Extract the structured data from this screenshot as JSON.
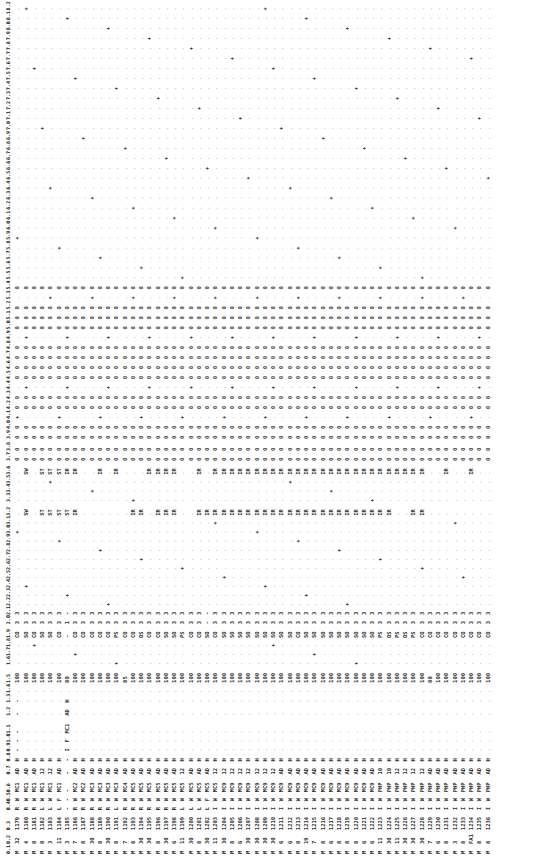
{
  "document": {
    "orientation": "rotated-90-ccw",
    "headers": [
      "0.1",
      "0.2",
      "0.3",
      "0.4",
      "0.5",
      "0.6",
      "0.7",
      "0.8",
      "0.9",
      "1.0",
      "1.1",
      "1.2",
      "1.3",
      "1.6",
      "1.5",
      "1.6",
      "1.7",
      "1.8",
      "1.9",
      "2.0",
      "2.1",
      "2.2",
      "2.3",
      "2.4",
      "2.5",
      "2.6",
      "2.7",
      "2.8",
      "2.9",
      "3.0",
      "3.1",
      "3.2",
      "3.3",
      "3.4",
      "3.5",
      "3.6",
      "3.7",
      "3.8",
      "3.9",
      "4.0",
      "4.1",
      "4.2",
      "4.3",
      "4.4",
      "4.5",
      "4.6",
      "4.7",
      "4.8",
      "4.9",
      "5.0",
      "5.1",
      "5.2",
      "5.3",
      "5.4",
      "5.5",
      "5.6",
      "5.7",
      "5.8",
      "5.9",
      "6.0",
      "6.1",
      "6.2",
      "6.3",
      "6.4",
      "6.5",
      "6.6",
      "6.7",
      "6.8",
      "6.9",
      "7.0",
      "7.1",
      "7.2",
      "7.3",
      "7.4",
      "7.5",
      "7.6",
      "7.7",
      "7.8",
      "7.9",
      "8.0",
      "8.1",
      "8.2"
    ],
    "rows": [
      {
        "c01": "M",
        "c02": "32",
        "c03": "1179",
        "c04": "R",
        "c05": "W",
        "c06": "MC1",
        "c07": "AD",
        "c08": "H",
        "c09": "-",
        "c10": "-",
        "c11": "-",
        "c12": "-",
        "c13": "-",
        "c14": "-",
        "c15": "100",
        "c16": "0",
        "c17": "*",
        "c18": "-",
        "c19": "CO",
        "c20": "3",
        "c21": "3",
        "c22": "+",
        "c23": ".",
        "c24": ".",
        "c25": ".",
        "c26": ".",
        "c27": ".",
        "c28": ".",
        "c29": ".",
        "c30": ".",
        "c31": ".",
        "c32": ".",
        "c33": ".",
        "c34": ".",
        "c35": ".",
        "c36": ".",
        "c37": "0",
        "c38": "0",
        "sw1": ".",
        "sw2": "."
      },
      {
        "c01": "M",
        "c02": "4",
        "c03": "1180",
        "c04": "R",
        "c05": "W",
        "c06": "MC1",
        "c07": "AD",
        "c08": "H",
        "c15": "100",
        "c19": "SO",
        "c20": "3",
        "c21": "3",
        "sw1": "SW",
        "sw2": "SW"
      },
      {
        "c01": "M",
        "c02": "8",
        "c03": "1181",
        "c04": "R",
        "c05": "W",
        "c06": "MC1",
        "c07": "AD",
        "c08": "H",
        "c15": "100",
        "c19": "CO",
        "c20": "3",
        "c21": "3",
        "sw1": ".",
        "sw2": "."
      },
      {
        "c01": "M",
        "c02": "8",
        "c03": "1182",
        "c04": "L",
        "c05": "W",
        "c06": "MC1",
        "c07": "12",
        "c08": "H",
        "c15": "100",
        "c19": "SO",
        "c20": "3",
        "c21": "3",
        "sw1": "ST",
        "sw2": "ST"
      },
      {
        "c01": "M",
        "c02": "3",
        "c03": "1183",
        "c04": "L",
        "c05": "W",
        "c06": "MC1",
        "c07": "12",
        "c08": "H",
        "c15": "100",
        "c19": "SO",
        "c20": "3",
        "c21": "3",
        "sw1": "ST",
        "sw2": "ST"
      },
      {
        "c01": "M",
        "c02": "11",
        "c03": "1184",
        "c04": "L",
        "c05": "F",
        "c06": "MC1",
        "c07": "AD",
        "c08": "H",
        "c15": "100",
        "c19": "CO",
        "c20": "3",
        "c21": "3",
        "sw1": "ST",
        "sw2": "ST"
      },
      {
        "c01": "M",
        "c02": "3",
        "c03": "1185",
        "c04": "-",
        "c05": "-",
        "c06": "-",
        "c07": "-",
        "c08": "-",
        "c09": "I",
        "c10": "F",
        "c11": "MC1",
        "c12": "AD",
        "c13": "H",
        "c15": "80",
        "c19": "-",
        "c20": "1",
        "c21": "-",
        "sw1": "ST",
        "sw2": "IR"
      },
      {
        "c01": "M",
        "c02": "7",
        "c03": "1186",
        "c04": "R",
        "c05": "W",
        "c06": "MC2",
        "c07": "AD",
        "c08": "H",
        "c15": "100",
        "c19": "CO",
        "c20": "3",
        "c21": "3",
        "sw1": "IR",
        "sw2": "IR"
      },
      {
        "c01": "M",
        "c02": "8",
        "c03": "1187",
        "c04": "R",
        "c05": "W",
        "c06": "MC2",
        "c07": "AD",
        "c08": "H",
        "c15": "100",
        "c19": "CO",
        "c20": "3",
        "c21": "3",
        "sw1": ".",
        "sw2": "."
      },
      {
        "c01": "M",
        "c02": "30",
        "c03": "1188",
        "c04": "R",
        "c05": "W",
        "c06": "MC3",
        "c07": "AD",
        "c08": "H",
        "c15": "100",
        "c19": "CO",
        "c20": "3",
        "c21": "3",
        "sw1": ".",
        "sw2": "."
      },
      {
        "c01": "M",
        "c02": "8",
        "c03": "1189",
        "c04": "R",
        "c05": "W",
        "c06": "MC3",
        "c07": "AD",
        "c08": "H",
        "c15": "100",
        "c19": "CO",
        "c20": "3",
        "c21": "3",
        "sw1": ".",
        "sw2": "IR"
      },
      {
        "c01": "M",
        "c02": "30",
        "c03": "1190",
        "c04": "R",
        "c05": "W",
        "c06": "MC3",
        "c07": "AD",
        "c08": "H",
        "c15": "100",
        "c19": "CO",
        "c20": "3",
        "c21": "3",
        "sw1": ".",
        "sw2": "."
      },
      {
        "c01": "M",
        "c02": "8",
        "c03": "1191",
        "c04": "L",
        "c05": "W",
        "c06": "MC3",
        "c07": "AD",
        "c08": "H",
        "c15": "100",
        "c19": "PS",
        "c20": "3",
        "c21": "3",
        "sw1": ".",
        "sw2": "IR"
      },
      {
        "c01": "M",
        "c02": "7",
        "c03": "1192",
        "c04": "R",
        "c05": "W",
        "c06": "MC4",
        "c07": "AD",
        "c08": "H",
        "c15": "85",
        "c19": "CO",
        "c20": "3",
        "c21": "3",
        "sw1": ".",
        "sw2": "."
      },
      {
        "c01": "M",
        "c02": "8",
        "c03": "1193",
        "c04": "R",
        "c05": "W",
        "c06": "MC5",
        "c07": "AD",
        "c08": "H",
        "c15": "100",
        "c19": "CO",
        "c20": "3",
        "c21": "3",
        "sw1": "IR",
        "sw2": "."
      },
      {
        "c01": "M",
        "c02": "30",
        "c03": "1194",
        "c04": "R",
        "c05": "W",
        "c06": "MC5",
        "c07": "AD",
        "c08": "H",
        "c15": "100",
        "c19": "OS",
        "c20": "3",
        "c21": "3",
        "sw1": "IR",
        "sw2": "."
      },
      {
        "c01": "M",
        "c02": "30",
        "c03": "1195",
        "c04": "R",
        "c05": "W",
        "c06": "MC5",
        "c07": "AD",
        "c08": "H",
        "c15": "100",
        "c19": "CO",
        "c20": "3",
        "c21": "3",
        "sw1": ".",
        "sw2": "IR"
      },
      {
        "c01": "M",
        "c02": "8",
        "c03": "1196",
        "c04": "R",
        "c05": "W",
        "c06": "MC5",
        "c07": "AD",
        "c08": "H",
        "c15": "100",
        "c19": "CO",
        "c20": "3",
        "c21": "3",
        "sw1": "IR",
        "sw2": "IR"
      },
      {
        "c01": "M",
        "c02": "30",
        "c03": "1197",
        "c04": "R",
        "c05": "W",
        "c06": "MC5",
        "c07": "AD",
        "c08": "H",
        "c15": "100",
        "c19": "SO",
        "c20": "3",
        "c21": "3",
        "sw1": "IR",
        "sw2": "IR"
      },
      {
        "c01": "M",
        "c02": "6",
        "c03": "1198",
        "c04": "R",
        "c05": "W",
        "c06": "MC5",
        "c07": "AD",
        "c08": "H",
        "c15": "100",
        "c19": "SO",
        "c20": "3",
        "c21": "3",
        "sw1": "IR",
        "sw2": "IR"
      },
      {
        "c01": "M",
        "c02": "11",
        "c03": "1199",
        "c04": "L",
        "c05": "W",
        "c06": "MC5",
        "c07": "12",
        "c08": "H",
        "c15": "100",
        "c19": "PS",
        "c20": "3",
        "c21": "3",
        "sw1": ".",
        "sw2": "."
      },
      {
        "c01": "M",
        "c02": "30",
        "c03": "1200",
        "c04": "L",
        "c05": "W",
        "c06": "MC5",
        "c07": "AD",
        "c08": "H",
        "c15": "100",
        "c19": "CO",
        "c20": "3",
        "c21": "3",
        "sw1": ".",
        "sw2": "."
      },
      {
        "c01": "M",
        "c02": "8",
        "c03": "1201",
        "c04": "L",
        "c05": "W",
        "c06": "MC5",
        "c07": "AD",
        "c08": "H",
        "c15": "100",
        "c19": "CO",
        "c20": "3",
        "c21": "3",
        "sw1": "IR",
        "sw2": "IR"
      },
      {
        "c01": "M",
        "c02": "30",
        "c03": "1202",
        "c04": "L",
        "c05": "F",
        "c06": "MC5",
        "c07": "AD",
        "c08": "H",
        "c15": "100",
        "c19": "SO",
        "c20": "-",
        "c21": "-",
        "sw1": "IR",
        "sw2": "."
      },
      {
        "c01": "M",
        "c02": "11",
        "c03": "1203",
        "c04": "I",
        "c05": "W",
        "c06": "MC5",
        "c07": "12",
        "c08": "H",
        "c15": "100",
        "c19": "CO",
        "c20": "3",
        "c21": "3",
        "sw1": "IR",
        "sw2": "IR"
      },
      {
        "c01": "M",
        "c02": "30",
        "c03": "1204",
        "c04": "I",
        "c05": "W",
        "c06": "MC9",
        "c07": "12",
        "c08": "H",
        "c15": "100",
        "c19": "SO",
        "c20": "3",
        "c21": "3",
        "sw1": "IR",
        "sw2": "IR"
      },
      {
        "c01": "M",
        "c02": "8",
        "c03": "1205",
        "c04": "I",
        "c05": "W",
        "c06": "MC9",
        "c07": "12",
        "c08": "H",
        "c15": "100",
        "c19": "SO",
        "c20": "3",
        "c21": "3",
        "sw1": "IR",
        "sw2": "IR"
      },
      {
        "c01": "M",
        "c02": "6",
        "c03": "1206",
        "c04": "I",
        "c05": "W",
        "c06": "MC9",
        "c07": "12",
        "c08": "H",
        "c15": "100",
        "c19": "SO",
        "c20": "3",
        "c21": "3",
        "sw1": "IR",
        "sw2": "IR"
      },
      {
        "c01": "M",
        "c02": "30",
        "c03": "1207",
        "c04": "I",
        "c05": "W",
        "c06": "MC9",
        "c07": "12",
        "c08": "H",
        "c15": "100",
        "c19": "SO",
        "c20": "3",
        "c21": "3",
        "sw1": "IR",
        "sw2": "IR"
      },
      {
        "c01": "M",
        "c02": "30",
        "c03": "1208",
        "c04": "I",
        "c05": "W",
        "c06": "MC9",
        "c07": "12",
        "c08": "H",
        "c15": "100",
        "c19": "SO",
        "c20": "3",
        "c21": "3",
        "sw1": "IR",
        "sw2": "IR"
      },
      {
        "c01": "M",
        "c02": "30",
        "c03": "1209",
        "c04": "I",
        "c05": "W",
        "c06": "MC9",
        "c07": "12",
        "c08": "H",
        "c15": "100",
        "c19": "SO",
        "c20": "3",
        "c21": "3",
        "sw1": "IR",
        "sw2": "IR"
      },
      {
        "c01": "M",
        "c02": "30",
        "c03": "1210",
        "c04": "I",
        "c05": "W",
        "c06": "MC9",
        "c07": "12",
        "c08": "H",
        "c15": "100",
        "c19": "SO",
        "c20": "3",
        "c21": "3",
        "sw1": "IR",
        "sw2": "IR"
      },
      {
        "c01": "M",
        "c02": "6",
        "c03": "1211",
        "c04": "I",
        "c05": "W",
        "c06": "MC9",
        "c07": "AD",
        "c08": "H",
        "c15": "100",
        "c19": "SO",
        "c20": "3",
        "c21": "3",
        "sw1": "IR",
        "sw2": "IR"
      },
      {
        "c01": "M",
        "c02": "6",
        "c03": "1212",
        "c04": "I",
        "c05": "W",
        "c06": "MC9",
        "c07": "AD",
        "c08": "H",
        "c15": "100",
        "c19": "SO",
        "c20": "3",
        "c21": "3",
        "sw1": "IR",
        "sw2": "IR"
      },
      {
        "c01": "M",
        "c02": "8",
        "c03": "1213",
        "c04": "I",
        "c05": "W",
        "c06": "MC9",
        "c07": "AD",
        "c08": "H",
        "c15": "100",
        "c19": "CO",
        "c20": "3",
        "c21": "3",
        "sw1": "IR",
        "sw2": "IR"
      },
      {
        "c01": "M",
        "c02": "19",
        "c03": "1214",
        "c04": "I",
        "c05": "W",
        "c06": "MC9",
        "c07": "AD",
        "c08": "H",
        "c15": "100",
        "c19": "SO",
        "c20": "3",
        "c21": "3",
        "sw1": "IR",
        "sw2": "IR"
      },
      {
        "c01": "M",
        "c02": "7",
        "c03": "1215",
        "c04": "I",
        "c05": "W",
        "c06": "MC9",
        "c07": "AD",
        "c08": "H",
        "c15": "100",
        "c19": "SO",
        "c20": "3",
        "c21": "3",
        "sw1": "IR",
        "sw2": "IR"
      },
      {
        "c01": "M",
        "c02": "8",
        "c03": "1216",
        "c04": "I",
        "c05": "W",
        "c06": "MC9",
        "c07": "AD",
        "c08": "H",
        "c15": "100",
        "c19": "SO",
        "c20": "3",
        "c21": "3",
        "sw1": "IR",
        "sw2": "IR"
      },
      {
        "c01": "M",
        "c02": "6",
        "c03": "1217",
        "c04": "I",
        "c05": "W",
        "c06": "MC9",
        "c07": "AD",
        "c08": "H",
        "c15": "100",
        "c19": "SO",
        "c20": "3",
        "c21": "3",
        "sw1": "IR",
        "sw2": "IR"
      },
      {
        "c01": "M",
        "c02": "8",
        "c03": "1218",
        "c04": "I",
        "c05": "W",
        "c06": "MC9",
        "c07": "AD",
        "c08": "H",
        "c15": "100",
        "c19": "SO",
        "c20": "3",
        "c21": "3",
        "sw1": "IR",
        "sw2": "IR"
      },
      {
        "c01": "M",
        "c02": "8",
        "c03": "1219",
        "c04": "I",
        "c05": "W",
        "c06": "MC9",
        "c07": "AD",
        "c08": "H",
        "c15": "100",
        "c19": "SO",
        "c20": "3",
        "c21": "3",
        "sw1": "IR",
        "sw2": "IR"
      },
      {
        "c01": "M",
        "c02": "8",
        "c03": "1220",
        "c04": "I",
        "c05": "W",
        "c06": "MC9",
        "c07": "AD",
        "c08": "H",
        "c15": "100",
        "c19": "SO",
        "c20": "3",
        "c21": "3",
        "sw1": "IR",
        "sw2": "IR"
      },
      {
        "c01": "M",
        "c02": "6",
        "c03": "1221",
        "c04": "I",
        "c05": "W",
        "c06": "MC9",
        "c07": "AD",
        "c08": "H",
        "c15": "100",
        "c19": "SO",
        "c20": "3",
        "c21": "3",
        "sw1": "IR",
        "sw2": "IR"
      },
      {
        "c01": "M",
        "c02": "6",
        "c03": "1222",
        "c04": "I",
        "c05": "W",
        "c06": "MC9",
        "c07": "AD",
        "c08": "H",
        "c15": "100",
        "c19": "SO",
        "c20": "3",
        "c21": "3",
        "sw1": "IR",
        "sw2": "IR"
      },
      {
        "c01": "M",
        "c02": "11",
        "c03": "1223",
        "c04": "I",
        "c05": "W",
        "c06": "PHP",
        "c07": "10",
        "c08": "H",
        "c15": "100",
        "c19": "PS",
        "c20": "3",
        "c21": "3",
        "sw1": "IR",
        "sw2": "IR"
      },
      {
        "c01": "M",
        "c02": "30",
        "c03": "1224",
        "c04": "I",
        "c05": "W",
        "c06": "PHP",
        "c07": "10",
        "c08": "H",
        "c15": "100",
        "c19": "OS",
        "c20": "3",
        "c21": "3",
        "sw1": "IR",
        "sw2": "IR"
      },
      {
        "c01": "M",
        "c02": "11",
        "c03": "1225",
        "c04": "I",
        "c05": "W",
        "c06": "PHP",
        "c07": "12",
        "c08": "H",
        "c15": "100",
        "c19": "PS",
        "c20": "3",
        "c21": "3",
        "sw1": ".",
        "sw2": "IR"
      },
      {
        "c01": "M",
        "c02": "30",
        "c03": "1226",
        "c04": "I",
        "c05": "W",
        "c06": "PHP",
        "c07": "12",
        "c08": "H",
        "c15": "100",
        "c19": "OS",
        "c20": "3",
        "c21": "3",
        "sw1": ".",
        "sw2": "IR"
      },
      {
        "c01": "M",
        "c02": "30",
        "c03": "1227",
        "c04": "I",
        "c05": "W",
        "c06": "PHP",
        "c07": "12",
        "c08": "H",
        "c15": "100",
        "c19": "PS",
        "c20": "3",
        "c21": "3",
        "sw1": "IR",
        "sw2": "IR"
      },
      {
        "c01": "M",
        "c02": "30",
        "c03": "1228",
        "c04": "I",
        "c05": "W",
        "c06": "PHP",
        "c07": "12",
        "c08": "H",
        "c15": "100",
        "c19": "CO",
        "c20": "3",
        "c21": "3",
        "sw1": "IR",
        "sw2": "IR"
      },
      {
        "c01": "M",
        "c02": "7",
        "c03": "1229",
        "c04": "I",
        "c05": "W",
        "c06": "PHP",
        "c07": "AD",
        "c08": "H",
        "c15": "80",
        "c19": "CO",
        "c20": "3",
        "c21": "3",
        "sw1": ".",
        "sw2": "."
      },
      {
        "c01": "M",
        "c02": "6",
        "c03": "1230",
        "c04": "I",
        "c05": "W",
        "c06": "PHP",
        "c07": "AD",
        "c08": "H",
        "c15": "100",
        "c19": "CO",
        "c20": "3",
        "c21": "3",
        "sw1": ".",
        "sw2": "."
      },
      {
        "c01": "M",
        "c02": "8",
        "c03": "1231",
        "c04": "I",
        "c05": "W",
        "c06": "PHP",
        "c07": "AD",
        "c08": "H",
        "c15": "100",
        "c19": "CO",
        "c20": "3",
        "c21": "3",
        "sw1": ".",
        "sw2": "IR"
      },
      {
        "c01": "M",
        "c02": "3",
        "c03": "1232",
        "c04": "I",
        "c05": "W",
        "c06": "PHP",
        "c07": "AD",
        "c08": "H",
        "c15": "100",
        "c19": "CO",
        "c20": "3",
        "c21": "3",
        "sw1": ".",
        "sw2": "."
      },
      {
        "c01": "M",
        "c02": "8",
        "c03": "1233",
        "c04": "I",
        "c05": "W",
        "c06": "PHP",
        "c07": "AD",
        "c08": "H",
        "c15": "100",
        "c19": "CO",
        "c20": "3",
        "c21": "3",
        "sw1": ".",
        "sw2": "."
      },
      {
        "c01": "M",
        "c02": "FA1",
        "c03": "1234",
        "c04": "I",
        "c05": "W",
        "c06": "PHP",
        "c07": "AD",
        "c08": "H",
        "c15": "100",
        "c19": "CO",
        "c20": "3",
        "c21": "3",
        "sw1": ".",
        "sw2": "IR"
      },
      {
        "c01": "M",
        "c02": "8",
        "c03": "1235",
        "c04": "I",
        "c05": "W",
        "c06": "PHP",
        "c07": "AD",
        "c08": "H",
        "c15": "100",
        "c19": "CO",
        "c20": "3",
        "c21": "3",
        "sw1": ".",
        "sw2": "."
      },
      {
        "c01": "M",
        "c02": "8",
        "c03": "1236",
        "c04": "I",
        "c05": "W",
        "c06": "PHP",
        "c07": "AD",
        "c08": "H",
        "c15": "100",
        "c19": "CO",
        "c20": "3",
        "c21": "3",
        "sw1": ".",
        "sw2": "."
      }
    ]
  }
}
